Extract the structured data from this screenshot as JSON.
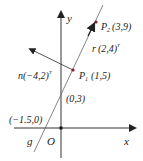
{
  "diagram": {
    "axes": {
      "x_label": "x",
      "y_label": "y",
      "origin_label": "O"
    },
    "line": {
      "label": "g"
    },
    "points": {
      "p2": {
        "name": "P",
        "sub": "2",
        "coords": "(3,9)"
      },
      "p1": {
        "name": "P",
        "sub": "1",
        "coords": "(1,5)"
      },
      "y_intercept": "(0,3)",
      "x_intercept": "(−1.5,0)"
    },
    "vectors": {
      "r": {
        "label": "r",
        "value": "(2,4)",
        "sup": "T"
      },
      "n": {
        "label": "n",
        "value": "(−4,2)",
        "sup": "T"
      }
    },
    "colors": {
      "axis": "#222222",
      "line": "#555555",
      "point": "#8b1a1a"
    }
  }
}
